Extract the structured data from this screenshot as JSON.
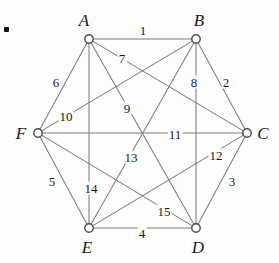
{
  "figure": {
    "width": 279,
    "height": 263,
    "background_color": "#fdfdfc",
    "edge_color": "#7d7d7d",
    "vertex_stroke_color": "#4a4a4a",
    "vertex_fill_color": "#ffffff",
    "text_color": "#1a1a1a"
  },
  "bullet": {
    "name": "item-bullet",
    "x": 4,
    "y": 27,
    "color": "#111111"
  },
  "vertices": [
    {
      "id": "A",
      "label": "A",
      "cx": 89,
      "cy": 39,
      "label_x": 84,
      "label_y": 20
    },
    {
      "id": "B",
      "label": "B",
      "cx": 196,
      "cy": 39,
      "label_x": 199,
      "label_y": 20
    },
    {
      "id": "C",
      "label": "C",
      "cx": 247,
      "cy": 133,
      "label_x": 263,
      "label_y": 133
    },
    {
      "id": "D",
      "label": "D",
      "cx": 196,
      "cy": 228,
      "label_x": 198,
      "label_y": 247
    },
    {
      "id": "E",
      "label": "E",
      "cx": 89,
      "cy": 228,
      "label_x": 87,
      "label_y": 247
    },
    {
      "id": "F",
      "label": "F",
      "cx": 38,
      "cy": 133,
      "label_x": 21,
      "label_y": 133
    }
  ],
  "edges": [
    {
      "id": "e1",
      "label": "1",
      "from": "A",
      "to": "B",
      "label_x": 143,
      "label_y": 30
    },
    {
      "id": "e2",
      "label": "2",
      "from": "B",
      "to": "C",
      "label_x": 226,
      "label_y": 82
    },
    {
      "id": "e3",
      "label": "3",
      "from": "C",
      "to": "D",
      "label_x": 232,
      "label_y": 181
    },
    {
      "id": "e4",
      "label": "4",
      "from": "E",
      "to": "D",
      "label_x": 142,
      "label_y": 233
    },
    {
      "id": "e5",
      "label": "5",
      "from": "F",
      "to": "E",
      "label_x": 52,
      "label_y": 181
    },
    {
      "id": "e6",
      "label": "6",
      "from": "A",
      "to": "F",
      "label_x": 56,
      "label_y": 82
    },
    {
      "id": "e7",
      "label": "7",
      "from": "A",
      "to": "C",
      "label_x": 122,
      "label_y": 58
    },
    {
      "id": "e8",
      "label": "8",
      "from": "B",
      "to": "D",
      "label_x": 194,
      "label_y": 82
    },
    {
      "id": "e9",
      "label": "9",
      "from": "A",
      "to": "D",
      "label_x": 127,
      "label_y": 108
    },
    {
      "id": "e10",
      "label": "10",
      "from": "B",
      "to": "F",
      "label_x": 66,
      "label_y": 116
    },
    {
      "id": "e11",
      "label": "11",
      "from": "F",
      "to": "C",
      "label_x": 175,
      "label_y": 134
    },
    {
      "id": "e12",
      "label": "12",
      "from": "E",
      "to": "C",
      "label_x": 216,
      "label_y": 155
    },
    {
      "id": "e13",
      "label": "13",
      "from": "B",
      "to": "E",
      "label_x": 131,
      "label_y": 157
    },
    {
      "id": "e14",
      "label": "14",
      "from": "A",
      "to": "E",
      "label_x": 91,
      "label_y": 188
    },
    {
      "id": "e15",
      "label": "15",
      "from": "F",
      "to": "D",
      "label_x": 164,
      "label_y": 211
    }
  ],
  "graph_data": {
    "type": "graph",
    "name": "K6",
    "vertex_count": 6,
    "edge_count": 15,
    "vertex_ids": [
      "A",
      "B",
      "C",
      "D",
      "E",
      "F"
    ],
    "edge_list": [
      [
        "A",
        "B",
        "1"
      ],
      [
        "B",
        "C",
        "2"
      ],
      [
        "C",
        "D",
        "3"
      ],
      [
        "E",
        "D",
        "4"
      ],
      [
        "F",
        "E",
        "5"
      ],
      [
        "A",
        "F",
        "6"
      ],
      [
        "A",
        "C",
        "7"
      ],
      [
        "B",
        "D",
        "8"
      ],
      [
        "A",
        "D",
        "9"
      ],
      [
        "B",
        "F",
        "10"
      ],
      [
        "F",
        "C",
        "11"
      ],
      [
        "E",
        "C",
        "12"
      ],
      [
        "B",
        "E",
        "13"
      ],
      [
        "A",
        "E",
        "14"
      ],
      [
        "F",
        "D",
        "15"
      ]
    ]
  }
}
